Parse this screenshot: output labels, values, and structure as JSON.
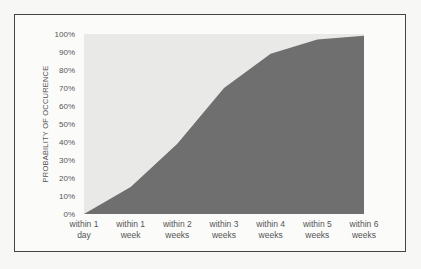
{
  "chart_data": {
    "type": "area",
    "title": "",
    "xlabel": "",
    "ylabel": "PROBABILITY OF OCCURENCE",
    "categories": [
      [
        "within 1",
        "day"
      ],
      [
        "within 1",
        "week"
      ],
      [
        "within 2",
        "weeks"
      ],
      [
        "within 3",
        "weeks"
      ],
      [
        "within 4",
        "weeks"
      ],
      [
        "within 5",
        "weeks"
      ],
      [
        "within 6",
        "weeks"
      ]
    ],
    "category_labels": [
      "within 1 day",
      "within 1 week",
      "within 2 weeks",
      "within 3 weeks",
      "within 4 weeks",
      "within 5 weeks",
      "within 6 weeks"
    ],
    "values": [
      0,
      15,
      39,
      70,
      89,
      97,
      99
    ],
    "yticks": [
      "0%",
      "10%",
      "20%",
      "30%",
      "40%",
      "50%",
      "60%",
      "70%",
      "80%",
      "90%",
      "100%"
    ],
    "ylim": [
      0,
      100
    ],
    "grid": false,
    "legend": "none",
    "colors": {
      "area_fill": "#6f6f6f",
      "plot_background": "#e9e9e7",
      "frame_border": "#444444",
      "text": "#555555"
    }
  }
}
